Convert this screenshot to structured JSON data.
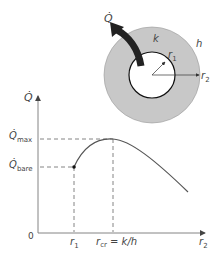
{
  "diagram": {
    "type": "critical-radius-of-insulation",
    "inset": {
      "heat_flow_label": "Q̇",
      "conductivity_label": "k",
      "convection_label": "h",
      "inner_radius_label": "r",
      "inner_radius_sub": "1",
      "outer_radius_label": "r",
      "outer_radius_sub": "2"
    },
    "plot": {
      "y_axis_label": "Q̇",
      "x_axis_label": "r",
      "x_axis_sub": "2",
      "origin_label": "0",
      "qmax_label": "Q̇",
      "qmax_sub": "max",
      "qbare_label": "Q̇",
      "qbare_sub": "bare",
      "r1_label": "r",
      "r1_sub": "1",
      "rcr_label": "r",
      "rcr_sub": "cr",
      "rcr_eq": " = k/h"
    },
    "colors": {
      "ring_fill": "#c8c8c8",
      "arrow": "#222222",
      "curve": "#555555",
      "axis": "#777777"
    }
  }
}
